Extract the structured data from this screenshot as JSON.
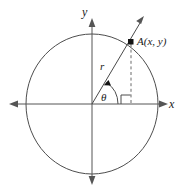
{
  "figure": {
    "kind": "unit-circle-trigonometry-diagram",
    "caption": "",
    "background_color": "#ffffff",
    "line_color": "#4d4d4d",
    "label_color": "#1a1a1a"
  },
  "axes": {
    "x_label": "x",
    "y_label": "y",
    "x_arrow_left": "◀",
    "x_arrow_right": "▶",
    "y_arrow_up": "▲",
    "y_arrow_down": "▼"
  },
  "labels": {
    "point": "A(x, y)",
    "radius": "r",
    "angle": "θ"
  },
  "geometry": {
    "center_x": 92,
    "center_y": 104,
    "radius_x": 66,
    "radius_y": 70,
    "point_x": 131,
    "point_y": 42,
    "ray_tip_x": 144,
    "ray_tip_y": 18,
    "angle_degrees": 58
  }
}
